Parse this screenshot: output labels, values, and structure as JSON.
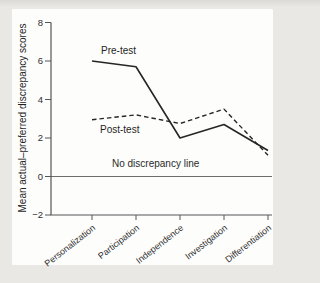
{
  "figure": {
    "background_color": "#e9e8e4",
    "plot_background_color": "#fdfdfc",
    "axis_color": "#565656",
    "line_color": "#262626"
  },
  "chart_data": {
    "type": "line",
    "title": "",
    "xlabel": "",
    "ylabel": "Mean actual–preferred discrepancy scores",
    "ylim": [
      -2,
      8
    ],
    "yticks": [
      8,
      6,
      4,
      2,
      0,
      -2
    ],
    "grid": false,
    "legend_position": "inline-labels",
    "categories": [
      "Personalization",
      "Participation",
      "Independence",
      "Investigation",
      "Differentiation"
    ],
    "series": [
      {
        "name": "Pre-test",
        "style": "solid",
        "values": [
          6.0,
          5.7,
          2.0,
          2.7,
          1.35
        ]
      },
      {
        "name": "Post-test",
        "style": "dashed",
        "values": [
          2.95,
          3.2,
          2.75,
          3.5,
          1.1
        ]
      }
    ],
    "reference_line": {
      "y": 0,
      "label": "No discrepancy line"
    }
  }
}
